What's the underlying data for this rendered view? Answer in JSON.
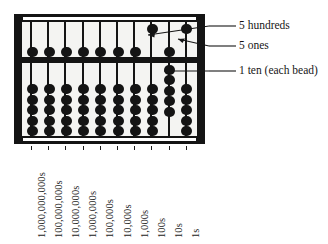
{
  "figure": {
    "kind": "abacus-diagram",
    "device_label": "abacus",
    "ink_color": "#141414",
    "background_color": "#ffffff"
  },
  "abacus": {
    "rod_count": 10,
    "upper_beads_per_rod": 1,
    "lower_beads_per_rod": 5,
    "upper_bead_value_multiplier": 5,
    "lower_bead_value_multiplier": 1,
    "columns": [
      {
        "index": 0,
        "label": "1,000,000,000s",
        "place_value": 1000000000,
        "upper_bead_active": false,
        "lower_beads_active": 0,
        "digit": 0
      },
      {
        "index": 1,
        "label": "100,000,000s",
        "place_value": 100000000,
        "upper_bead_active": false,
        "lower_beads_active": 0,
        "digit": 0
      },
      {
        "index": 2,
        "label": "10,000,000s",
        "place_value": 10000000,
        "upper_bead_active": false,
        "lower_beads_active": 0,
        "digit": 0
      },
      {
        "index": 3,
        "label": "1,000,000s",
        "place_value": 1000000,
        "upper_bead_active": false,
        "lower_beads_active": 0,
        "digit": 0
      },
      {
        "index": 4,
        "label": "100,000s",
        "place_value": 100000,
        "upper_bead_active": false,
        "lower_beads_active": 0,
        "digit": 0
      },
      {
        "index": 5,
        "label": "10,000s",
        "place_value": 10000,
        "upper_bead_active": false,
        "lower_beads_active": 0,
        "digit": 0
      },
      {
        "index": 6,
        "label": "1,000s",
        "place_value": 1000,
        "upper_bead_active": false,
        "lower_beads_active": 0,
        "digit": 0
      },
      {
        "index": 7,
        "label": "100s",
        "place_value": 100,
        "upper_bead_active": true,
        "lower_beads_active": 0,
        "digit": 5
      },
      {
        "index": 8,
        "label": "10s",
        "place_value": 10,
        "upper_bead_active": false,
        "lower_beads_active": 5,
        "digit": 5
      },
      {
        "index": 9,
        "label": "1s",
        "place_value": 1,
        "upper_bead_active": true,
        "lower_beads_active": 0,
        "digit": 5
      }
    ]
  },
  "annotations": [
    {
      "id": "hundreds",
      "text": "5 hundreds",
      "points_to": "100s-upper-bead"
    },
    {
      "id": "ones",
      "text": "5 ones",
      "points_to": "1s-upper-bead"
    },
    {
      "id": "tens",
      "text": "1 ten (each bead)",
      "points_to": "10s-lower-beads"
    }
  ]
}
